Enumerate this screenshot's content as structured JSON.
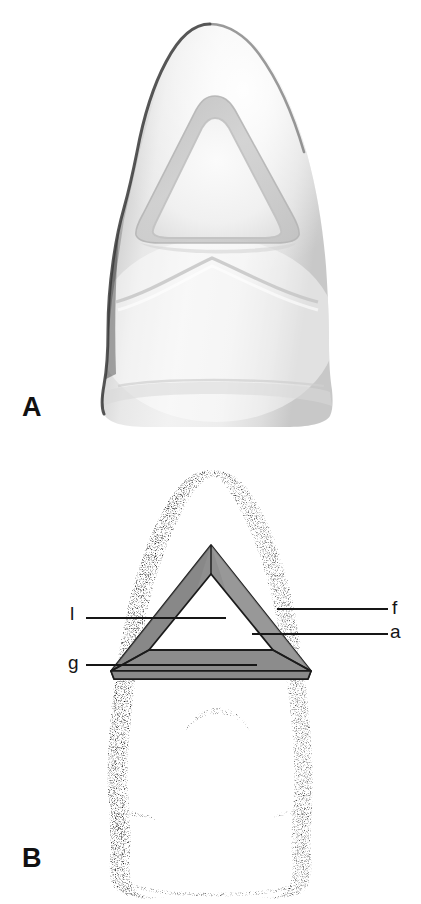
{
  "figure": {
    "panels": [
      {
        "id": "A",
        "letter": "A",
        "caption_letter": "A",
        "description": "Shaded three-dimensional rendering of an anterior tooth crown viewed from the lingual surface, showing the triangular outline form of the endodontic access cavity preparation."
      },
      {
        "id": "B",
        "letter": "B",
        "caption_letter": "B",
        "description": "Stippled line drawing of the same anterior tooth, lingual view, with the triangular access cavity outline shaded gray and its walls labeled."
      }
    ],
    "labels": [
      {
        "key": "l",
        "text": "l",
        "side": "left",
        "meaning": "lingual wall"
      },
      {
        "key": "g",
        "text": "g",
        "side": "left",
        "meaning": "gingival wall"
      },
      {
        "key": "f",
        "text": "f",
        "side": "right",
        "meaning": "facial / axial wall"
      },
      {
        "key": "a",
        "text": "a",
        "side": "right",
        "meaning": "access cavity floor"
      }
    ],
    "colors": {
      "background": "#ffffff",
      "ink": "#161616",
      "triangle_fill": "#8f8f8f",
      "triangle_fill_light": "#a0a0a0",
      "triangle_fill_dark": "#7d7d7d",
      "triangle_stroke": "#1a1a1a",
      "stipple": "#1c1c1c",
      "enamel_light": "#f2f2f2",
      "enamel_mid": "#d8d8d8",
      "enamel_shadow": "#6e6e6e"
    }
  }
}
